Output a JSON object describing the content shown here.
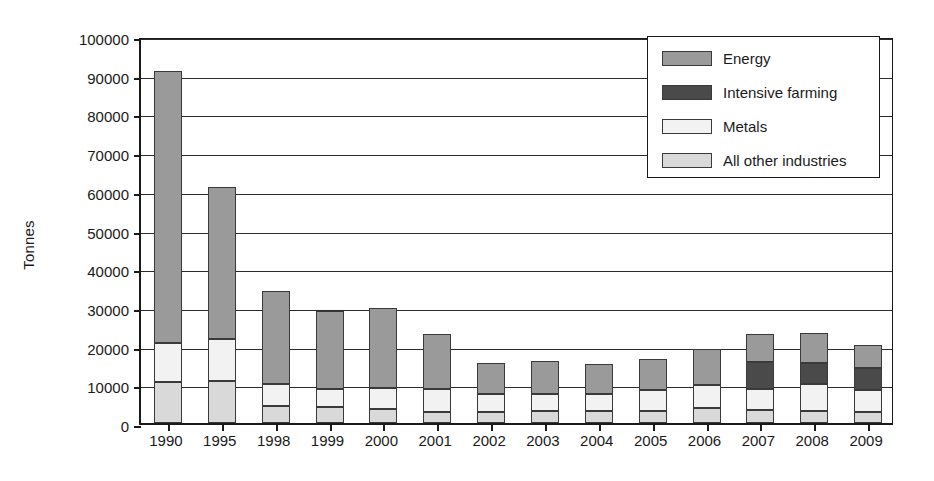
{
  "chart_data": {
    "type": "bar",
    "subtype": "stacked-vertical",
    "title": "",
    "xlabel": "",
    "ylabel": "Tonnes",
    "ylim": [
      0,
      100000
    ],
    "ytick_labels": [
      "100000",
      "90000",
      "80000",
      "70000",
      "60000",
      "50000",
      "40000",
      "30000",
      "20000",
      "10000",
      "0"
    ],
    "ytick_values": [
      100000,
      90000,
      80000,
      70000,
      60000,
      50000,
      40000,
      30000,
      20000,
      10000,
      0
    ],
    "grid": true,
    "legend_position": "top-right",
    "categories": [
      "1990",
      "1995",
      "1998",
      "1999",
      "2000",
      "2001",
      "2002",
      "2003",
      "2004",
      "2005",
      "2006",
      "2007",
      "2008",
      "2009"
    ],
    "series": [
      {
        "name": "Energy",
        "color": "#9a9a9a",
        "values": [
          70300,
          39300,
          24000,
          20200,
          20800,
          14100,
          8000,
          8700,
          7700,
          8100,
          9400,
          7200,
          7600,
          5900
        ]
      },
      {
        "name": "Intensive farming",
        "color": "#4a4a4a",
        "values": [
          0,
          0,
          0,
          0,
          0,
          0,
          0,
          0,
          0,
          0,
          0,
          7000,
          5500,
          5700
        ]
      },
      {
        "name": "Metals",
        "color": "#f2f2f2",
        "values": [
          10100,
          10800,
          5700,
          4700,
          5300,
          6100,
          4600,
          4400,
          4500,
          5400,
          5900,
          5500,
          7000,
          5800
        ]
      },
      {
        "name": "All other industries",
        "color": "#d9d9d9",
        "values": [
          10600,
          10900,
          4300,
          4100,
          3700,
          2800,
          2900,
          3000,
          3100,
          3000,
          3900,
          3300,
          3100,
          2800
        ]
      }
    ],
    "totals": [
      91000,
      61000,
      34000,
      29000,
      29800,
      23000,
      15500,
      16100,
      15300,
      16500,
      19200,
      23000,
      23200,
      20200
    ]
  },
  "legend": {
    "items": [
      {
        "label": "Energy"
      },
      {
        "label": "Intensive farming"
      },
      {
        "label": "Metals"
      },
      {
        "label": "All other industries"
      }
    ]
  }
}
